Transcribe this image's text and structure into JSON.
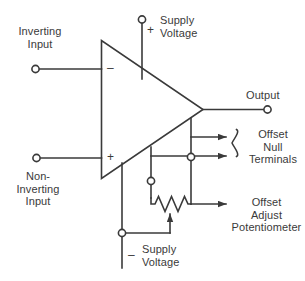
{
  "diagram": {
    "type": "circuit-schematic",
    "colors": {
      "background": "#ffffff",
      "wire": "#3a3a3a",
      "text": "#3a3a3a",
      "terminal_fill": "#ffffff"
    },
    "labels": {
      "inverting_input": "Inverting\nInput",
      "non_inverting_input": "Non-\nInverting\nInput",
      "positive_supply": "Supply\nVoltage",
      "negative_supply": "Supply\nVoltage",
      "output": "Output",
      "offset_null_terminals": "Offset\nNull\nTerminals",
      "offset_adjust_potentiometer": "Offset\nAdjust\nPotentiometer"
    },
    "signs": {
      "inverting_terminal": "–",
      "non_inverting_terminal": "+",
      "positive_supply": "+",
      "negative_supply": "–"
    },
    "components": [
      {
        "name": "op-amp-triangle",
        "kind": "amplifier"
      },
      {
        "name": "offset-adjust-potentiometer",
        "kind": "potentiometer"
      }
    ],
    "terminals": [
      {
        "name": "inverting-input-terminal",
        "label": "Inverting Input"
      },
      {
        "name": "non-inverting-input-terminal",
        "label": "Non-Inverting Input"
      },
      {
        "name": "positive-supply-terminal",
        "label": "+ Supply Voltage"
      },
      {
        "name": "negative-supply-terminal",
        "label": "– Supply Voltage"
      },
      {
        "name": "output-terminal",
        "label": "Output"
      },
      {
        "name": "offset-null-terminal-1",
        "label": "Offset Null"
      },
      {
        "name": "offset-null-terminal-2",
        "label": "Offset Null"
      }
    ]
  }
}
